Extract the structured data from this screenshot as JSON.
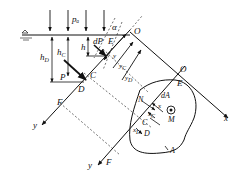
{
  "figure": {
    "type": "hydrostatic pressure on an inclined plane surface",
    "labels": {
      "p_a": "pₐ",
      "alpha": "α",
      "h": "h",
      "h_C": "h",
      "h_C_sub": "C",
      "h_D": "h",
      "h_D_sub": "D",
      "dP": "dP",
      "E_top": "E",
      "P": "P",
      "C_top": "C",
      "D_top": "D",
      "O_top": "O",
      "O_right": "O",
      "E_right": "E",
      "F_left": "F",
      "y_left": "y",
      "y_bottom": "y",
      "F_bottom": "F",
      "x_axis": "x",
      "y_dim": "y",
      "y_C_dim": "y",
      "y_C_sub": "C",
      "y_D_dim": "y",
      "y_D_sub": "D",
      "N": "N",
      "dA": "dA",
      "x_dim": "x",
      "x_C": "x",
      "x_C_sub": "C",
      "x_D": "x",
      "x_D_sub": "D",
      "C_plane": "C",
      "D_plane": "D",
      "M": "M",
      "A": "A"
    },
    "colors": {
      "ink": "#111111",
      "background": "#ffffff"
    }
  }
}
